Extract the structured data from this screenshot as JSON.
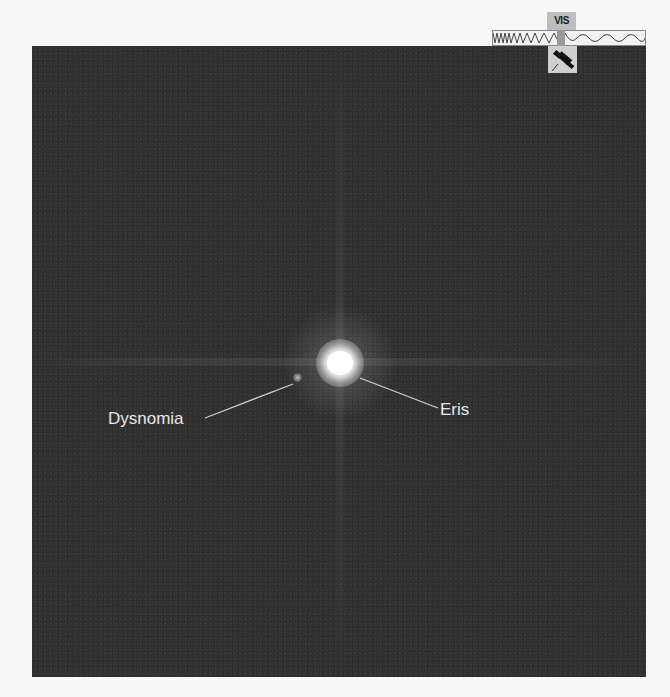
{
  "image": {
    "description": "Hubble visible-light image of dwarf planet Eris and its moon Dysnomia",
    "background_color": "#2b2b2b",
    "labels": {
      "primary": "Eris",
      "moon": "Dysnomia"
    }
  },
  "badge": {
    "band_label": "VIS",
    "icon": "telescope-icon",
    "spectrum_icon": "wavelength-wave-icon"
  }
}
